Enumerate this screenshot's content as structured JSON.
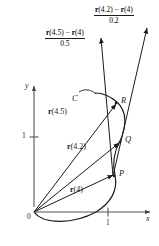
{
  "figure": {
    "axes": {
      "x_label": "x",
      "y_label": "y",
      "x_tick_label": "1",
      "y_tick_label": "1",
      "origin_label": "0"
    },
    "curve_label": "C",
    "points": [
      {
        "name": "point-p",
        "label": "P"
      },
      {
        "name": "point-q",
        "label": "Q"
      },
      {
        "name": "point-r",
        "label": "R"
      }
    ],
    "position_vectors": [
      {
        "name": "vector-r45",
        "label_html": "r(4.5)",
        "fn": "r",
        "arg": "(4.5)"
      },
      {
        "name": "vector-r42",
        "label_html": "r(4.2)",
        "fn": "r",
        "arg": "(4.2)"
      },
      {
        "name": "vector-r4",
        "label_html": "r(4)",
        "fn": "r",
        "arg": "(4)"
      }
    ],
    "difference_quotients": [
      {
        "name": "secant-vector-0-5",
        "numerator_parts": {
          "a_fn": "r",
          "a_arg": "(4.5)",
          "minus": "−",
          "b_fn": "r",
          "b_arg": "(4)"
        },
        "numerator_text": "r(4.5) − r(4)",
        "denominator": "0.5"
      },
      {
        "name": "secant-vector-0-2",
        "numerator_parts": {
          "a_fn": "r",
          "a_arg": "(4.2)",
          "minus": "−",
          "b_fn": "r",
          "b_arg": "(4)"
        },
        "numerator_text": "r(4.2) − r(4)",
        "denominator": "0.2"
      }
    ],
    "colors": {
      "ink": "#1a1a1a",
      "axis": "#555555",
      "background": "#ffffff"
    }
  }
}
